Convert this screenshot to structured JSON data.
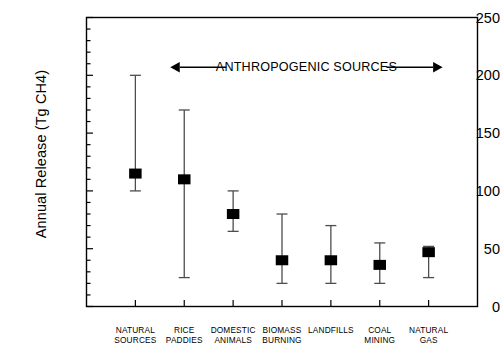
{
  "chart_data": {
    "type": "scatter",
    "title": "",
    "subtitle": "",
    "xlabel": "",
    "ylabel": "Annual Release (Tg CH4)",
    "ylim": [
      0,
      250
    ],
    "ytick_values": [
      0,
      50,
      100,
      150,
      200,
      250
    ],
    "ytick_labels": [
      "0",
      "50",
      "100",
      "150",
      "200",
      "250"
    ],
    "y_minor_tick_step": 10,
    "grid": false,
    "legend": "none",
    "marker_style": "filled-square",
    "error_bar_style": "capped-vertical",
    "categories": [
      "NATURAL SOURCES",
      "RICE PADDIES",
      "DOMESTIC ANIMALS",
      "BIOMASS BURNING",
      "LANDFILLS",
      "COAL MINING",
      "NATURAL GAS"
    ],
    "category_label_lines": [
      [
        "NATURAL",
        "SOURCES"
      ],
      [
        "RICE",
        "PADDIES"
      ],
      [
        "DOMESTIC",
        "ANIMALS"
      ],
      [
        "BIOMASS",
        "BURNING"
      ],
      [
        "LANDFILLS",
        ""
      ],
      [
        "COAL",
        "MINING"
      ],
      [
        "NATURAL",
        "GAS"
      ]
    ],
    "values": [
      115,
      110,
      80,
      40,
      40,
      36,
      47
    ],
    "err_low": [
      100,
      25,
      65,
      20,
      20,
      20,
      25
    ],
    "err_high": [
      200,
      170,
      100,
      80,
      70,
      55,
      52
    ],
    "annotations": [
      {
        "text": "ANTHROPOGENIC SOURCES",
        "y_value": 207,
        "span_categories": [
          2,
          7
        ],
        "arrow": "double"
      }
    ]
  },
  "colors": {
    "axis": "#000000",
    "marker": "#000000",
    "error_bar": "#4d4d4d",
    "text": "#000000",
    "background": "#ffffff"
  }
}
